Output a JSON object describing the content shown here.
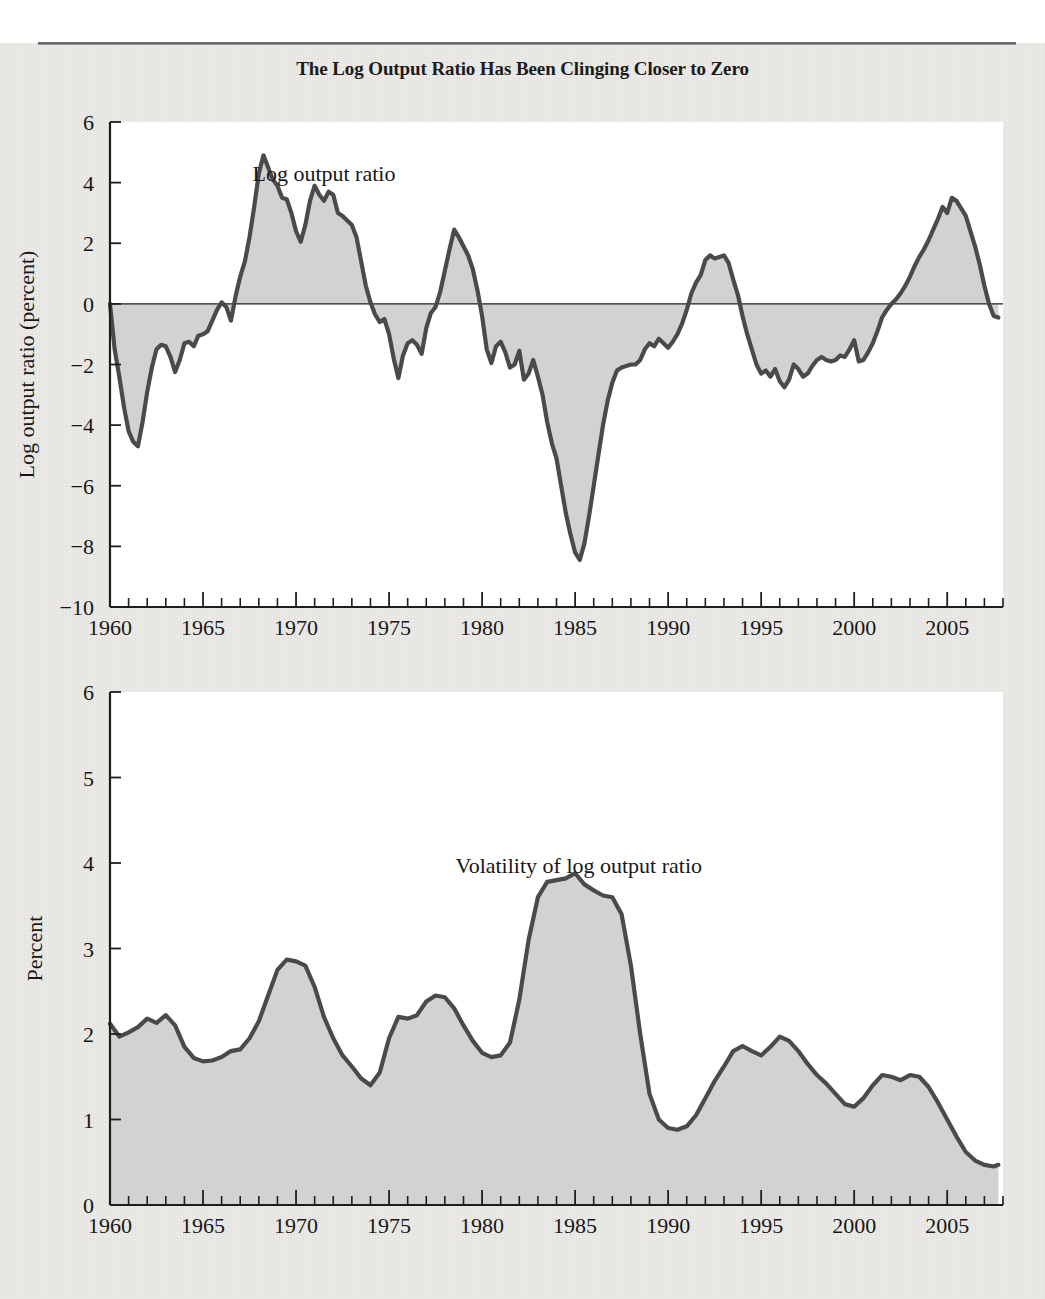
{
  "figure": {
    "title": "The Log Output Ratio Has Been Clinging Closer to Zero",
    "background_color": "#eceae6",
    "series_line_color": "#4a4a4a",
    "series_fill_color": "#d0d0d0",
    "plot_background_color": "#ffffff"
  },
  "chart_data": [
    {
      "id": "log-output-ratio",
      "type": "area",
      "title": "",
      "annotation": "Log output ratio",
      "annotation_x": 1971.5,
      "annotation_y": 4.05,
      "xlabel": "",
      "ylabel": "Log output ratio (percent)",
      "xlim": [
        1960,
        2008.0
      ],
      "ylim": [
        -10,
        6
      ],
      "baseline": 0,
      "grid": false,
      "legend": "none",
      "xticks": [
        1960,
        1965,
        1970,
        1975,
        1980,
        1985,
        1990,
        1995,
        2000,
        2005
      ],
      "xtick_labels": [
        "1960",
        "1965",
        "1970",
        "1975",
        "1980",
        "1985",
        "1990",
        "1995",
        "2000",
        "2005"
      ],
      "xtick_minor_step": 1,
      "yticks": [
        6,
        4,
        2,
        0,
        -2,
        -4,
        -6,
        -8,
        -10
      ],
      "ytick_labels": [
        "6",
        "4",
        "2",
        "0",
        "−2",
        "−4",
        "−6",
        "−8",
        "−10"
      ],
      "x": [
        1960.0,
        1960.25,
        1960.5,
        1960.75,
        1961.0,
        1961.25,
        1961.5,
        1961.75,
        1962.0,
        1962.25,
        1962.5,
        1962.75,
        1963.0,
        1963.25,
        1963.5,
        1963.75,
        1964.0,
        1964.25,
        1964.5,
        1964.75,
        1965.0,
        1965.25,
        1965.5,
        1965.75,
        1966.0,
        1966.25,
        1966.5,
        1966.75,
        1967.0,
        1967.25,
        1967.5,
        1967.75,
        1968.0,
        1968.25,
        1968.5,
        1968.75,
        1969.0,
        1969.25,
        1969.5,
        1969.75,
        1970.0,
        1970.25,
        1970.5,
        1970.75,
        1971.0,
        1971.25,
        1971.5,
        1971.75,
        1972.0,
        1972.25,
        1972.5,
        1972.75,
        1973.0,
        1973.25,
        1973.5,
        1973.75,
        1974.0,
        1974.25,
        1974.5,
        1974.75,
        1975.0,
        1975.25,
        1975.5,
        1975.75,
        1976.0,
        1976.25,
        1976.5,
        1976.75,
        1977.0,
        1977.25,
        1977.5,
        1977.75,
        1978.0,
        1978.25,
        1978.5,
        1978.75,
        1979.0,
        1979.25,
        1979.5,
        1979.75,
        1980.0,
        1980.25,
        1980.5,
        1980.75,
        1981.0,
        1981.25,
        1981.5,
        1981.75,
        1982.0,
        1982.25,
        1982.5,
        1982.75,
        1983.0,
        1983.25,
        1983.5,
        1983.75,
        1984.0,
        1984.25,
        1984.5,
        1984.75,
        1985.0,
        1985.25,
        1985.5,
        1985.75,
        1986.0,
        1986.25,
        1986.5,
        1986.75,
        1987.0,
        1987.25,
        1987.5,
        1987.75,
        1988.0,
        1988.25,
        1988.5,
        1988.75,
        1989.0,
        1989.25,
        1989.5,
        1989.75,
        1990.0,
        1990.25,
        1990.5,
        1990.75,
        1991.0,
        1991.25,
        1991.5,
        1991.75,
        1992.0,
        1992.25,
        1992.5,
        1992.75,
        1993.0,
        1993.25,
        1993.5,
        1993.75,
        1994.0,
        1994.25,
        1994.5,
        1994.75,
        1995.0,
        1995.25,
        1995.5,
        1995.75,
        1996.0,
        1996.25,
        1996.5,
        1996.75,
        1997.0,
        1997.25,
        1997.5,
        1997.75,
        1998.0,
        1998.25,
        1998.5,
        1998.75,
        1999.0,
        1999.25,
        1999.5,
        1999.75,
        2000.0,
        2000.25,
        2000.5,
        2000.75,
        2001.0,
        2001.25,
        2001.5,
        2001.75,
        2002.0,
        2002.25,
        2002.5,
        2002.75,
        2003.0,
        2003.25,
        2003.5,
        2003.75,
        2004.0,
        2004.25,
        2004.5,
        2004.75,
        2005.0,
        2005.25,
        2005.5,
        2005.75,
        2006.0,
        2006.25,
        2006.5,
        2006.75,
        2007.0,
        2007.25,
        2007.5,
        2007.75
      ],
      "y": [
        0.0,
        -1.5,
        -2.4,
        -3.4,
        -4.2,
        -4.55,
        -4.7,
        -3.9,
        -2.9,
        -2.1,
        -1.5,
        -1.35,
        -1.4,
        -1.75,
        -2.25,
        -1.85,
        -1.3,
        -1.25,
        -1.4,
        -1.05,
        -1.0,
        -0.9,
        -0.55,
        -0.2,
        0.05,
        -0.1,
        -0.55,
        0.25,
        0.9,
        1.4,
        2.2,
        3.2,
        4.3,
        4.9,
        4.5,
        4.1,
        3.9,
        3.5,
        3.45,
        3.0,
        2.4,
        2.05,
        2.6,
        3.4,
        3.9,
        3.6,
        3.4,
        3.7,
        3.6,
        3.0,
        2.9,
        2.75,
        2.6,
        2.2,
        1.4,
        0.6,
        0.05,
        -0.35,
        -0.6,
        -0.5,
        -1.0,
        -1.8,
        -2.45,
        -1.7,
        -1.3,
        -1.2,
        -1.35,
        -1.65,
        -0.8,
        -0.3,
        -0.1,
        0.4,
        1.1,
        1.8,
        2.45,
        2.2,
        1.9,
        1.6,
        1.15,
        0.45,
        -0.4,
        -1.5,
        -1.95,
        -1.4,
        -1.25,
        -1.6,
        -2.1,
        -2.0,
        -1.55,
        -2.5,
        -2.3,
        -1.85,
        -2.4,
        -3.0,
        -3.9,
        -4.6,
        -5.1,
        -6.0,
        -6.9,
        -7.6,
        -8.2,
        -8.45,
        -7.9,
        -7.0,
        -6.0,
        -5.0,
        -4.0,
        -3.2,
        -2.6,
        -2.2,
        -2.1,
        -2.05,
        -2.0,
        -2.0,
        -1.85,
        -1.5,
        -1.3,
        -1.4,
        -1.15,
        -1.3,
        -1.45,
        -1.25,
        -1.0,
        -0.65,
        -0.2,
        0.35,
        0.7,
        0.95,
        1.45,
        1.6,
        1.5,
        1.55,
        1.6,
        1.35,
        0.8,
        0.3,
        -0.4,
        -1.0,
        -1.5,
        -2.0,
        -2.3,
        -2.2,
        -2.4,
        -2.15,
        -2.55,
        -2.75,
        -2.5,
        -2.0,
        -2.15,
        -2.4,
        -2.3,
        -2.05,
        -1.85,
        -1.75,
        -1.85,
        -1.9,
        -1.85,
        -1.7,
        -1.75,
        -1.5,
        -1.2,
        -1.9,
        -1.85,
        -1.6,
        -1.3,
        -0.9,
        -0.45,
        -0.2,
        0.0,
        0.15,
        0.35,
        0.6,
        0.9,
        1.25,
        1.55,
        1.8,
        2.1,
        2.45,
        2.8,
        3.2,
        3.0,
        3.5,
        3.4,
        3.15,
        2.9,
        2.4,
        1.9,
        1.3,
        0.6,
        0.0,
        -0.4,
        -0.45,
        -0.3,
        -0.55,
        -1.0,
        -1.35,
        -1.1,
        -0.6,
        -0.35,
        -0.3,
        -0.15,
        0.05,
        0.3,
        0.2,
        0.5,
        0.35,
        0.55,
        0.15,
        -0.05,
        -0.55,
        -0.2,
        0.35,
        0.0,
        -0.25,
        0.05
      ]
    },
    {
      "id": "volatility-of-log-output-ratio",
      "type": "area",
      "title": "",
      "annotation": "Volatility of log output ratio",
      "annotation_x": 1985.2,
      "annotation_y": 3.88,
      "xlabel": "",
      "ylabel": "Percent",
      "xlim": [
        1960,
        2008.0
      ],
      "ylim": [
        0,
        6
      ],
      "baseline": 0,
      "grid": false,
      "legend": "none",
      "xticks": [
        1960,
        1965,
        1970,
        1975,
        1980,
        1985,
        1990,
        1995,
        2000,
        2005
      ],
      "xtick_labels": [
        "1960",
        "1965",
        "1970",
        "1975",
        "1980",
        "1985",
        "1990",
        "1995",
        "2000",
        "2005"
      ],
      "xtick_minor_step": 1,
      "yticks": [
        0,
        1,
        2,
        3,
        4,
        5,
        6
      ],
      "ytick_labels": [
        "0",
        "1",
        "2",
        "3",
        "4",
        "5",
        "6"
      ],
      "x": [
        1960.0,
        1960.5,
        1961.0,
        1961.5,
        1962.0,
        1962.5,
        1963.0,
        1963.5,
        1964.0,
        1964.5,
        1965.0,
        1965.5,
        1966.0,
        1966.5,
        1967.0,
        1967.5,
        1968.0,
        1968.5,
        1969.0,
        1969.5,
        1970.0,
        1970.5,
        1971.0,
        1971.5,
        1972.0,
        1972.5,
        1973.0,
        1973.5,
        1974.0,
        1974.5,
        1975.0,
        1975.5,
        1976.0,
        1976.5,
        1977.0,
        1977.5,
        1978.0,
        1978.5,
        1979.0,
        1979.5,
        1980.0,
        1980.5,
        1981.0,
        1981.5,
        1982.0,
        1982.5,
        1983.0,
        1983.5,
        1984.0,
        1984.5,
        1985.0,
        1985.5,
        1986.0,
        1986.5,
        1987.0,
        1987.5,
        1988.0,
        1988.5,
        1989.0,
        1989.5,
        1990.0,
        1990.5,
        1991.0,
        1991.5,
        1992.0,
        1992.5,
        1993.0,
        1993.5,
        1994.0,
        1994.5,
        1995.0,
        1995.5,
        1996.0,
        1996.5,
        1997.0,
        1997.5,
        1998.0,
        1998.5,
        1999.0,
        1999.5,
        2000.0,
        2000.5,
        2001.0,
        2001.5,
        2002.0,
        2002.5,
        2003.0,
        2003.5,
        2004.0,
        2004.5,
        2005.0,
        2005.5,
        2006.0,
        2006.5,
        2007.0,
        2007.5,
        2007.75
      ],
      "y": [
        2.12,
        1.97,
        2.02,
        2.08,
        2.18,
        2.13,
        2.22,
        2.1,
        1.85,
        1.72,
        1.68,
        1.69,
        1.73,
        1.8,
        1.82,
        1.95,
        2.15,
        2.45,
        2.75,
        2.87,
        2.85,
        2.8,
        2.55,
        2.2,
        1.95,
        1.75,
        1.62,
        1.48,
        1.4,
        1.55,
        1.95,
        2.2,
        2.18,
        2.22,
        2.38,
        2.45,
        2.43,
        2.3,
        2.1,
        1.92,
        1.78,
        1.73,
        1.75,
        1.9,
        2.4,
        3.1,
        3.6,
        3.78,
        3.8,
        3.82,
        3.88,
        3.75,
        3.68,
        3.62,
        3.6,
        3.4,
        2.8,
        2.0,
        1.3,
        1.0,
        0.9,
        0.88,
        0.92,
        1.05,
        1.25,
        1.45,
        1.62,
        1.8,
        1.86,
        1.8,
        1.75,
        1.85,
        1.97,
        1.92,
        1.8,
        1.65,
        1.52,
        1.42,
        1.3,
        1.18,
        1.15,
        1.25,
        1.4,
        1.52,
        1.5,
        1.46,
        1.52,
        1.5,
        1.38,
        1.2,
        1.0,
        0.8,
        0.62,
        0.52,
        0.47,
        0.45,
        0.47
      ]
    }
  ]
}
